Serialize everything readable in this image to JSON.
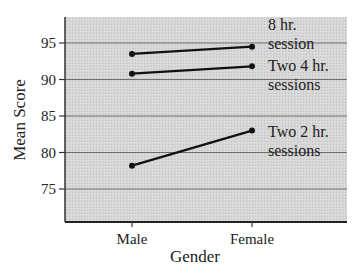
{
  "chart_data": {
    "type": "line",
    "title": "",
    "xlabel": "Gender",
    "ylabel": "Mean Score",
    "categories": [
      "Male",
      "Female"
    ],
    "yticks": [
      75,
      80,
      85,
      90,
      95
    ],
    "ylim": [
      71,
      98
    ],
    "grid": true,
    "legend_position": "inline-right",
    "series": [
      {
        "name": "8 hr. session",
        "label_lines": [
          "8 hr.",
          "session"
        ],
        "values": [
          93.5,
          94.5
        ]
      },
      {
        "name": "Two 4 hr. sessions",
        "label_lines": [
          "Two 4 hr.",
          "sessions"
        ],
        "values": [
          90.8,
          91.8
        ]
      },
      {
        "name": "Two 2 hr. sessions",
        "label_lines": [
          "Two 2 hr.",
          "sessions"
        ],
        "values": [
          78.2,
          83.0
        ]
      }
    ]
  },
  "colors": {
    "plot_background": "#d9d9d9",
    "gridline": "#6e6e6e",
    "line": "#111111",
    "text": "#222222"
  }
}
